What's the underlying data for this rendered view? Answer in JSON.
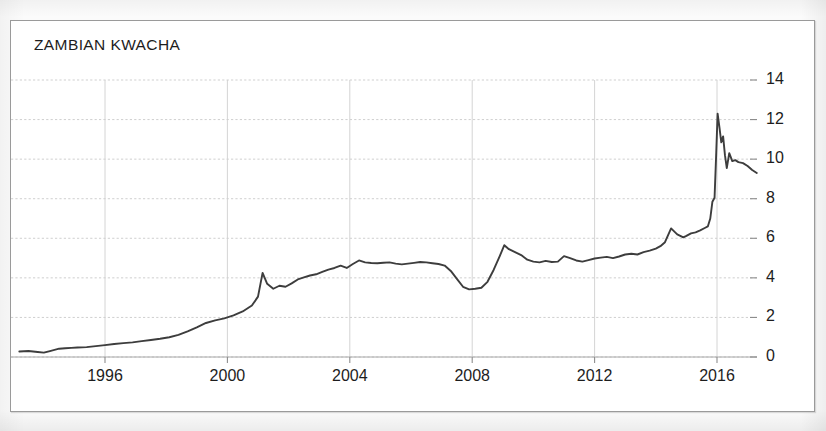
{
  "chart_data": {
    "type": "line",
    "title": "ZAMBIAN KWACHA",
    "xlabel": "",
    "ylabel": "",
    "xlim": [
      1993.2,
      2017.3
    ],
    "ylim": [
      0,
      14
    ],
    "grid": true,
    "legend": "none",
    "series_color": "#3d3d3d",
    "x_ticks": [
      "1996",
      "2000",
      "2004",
      "2008",
      "2012",
      "2016"
    ],
    "x_tick_values": [
      1996,
      2000,
      2004,
      2008,
      2012,
      2016
    ],
    "y_ticks": [
      "0",
      "2",
      "4",
      "6",
      "8",
      "10",
      "12",
      "14"
    ],
    "y_tick_values": [
      0,
      2,
      4,
      6,
      8,
      10,
      12,
      14
    ],
    "series": [
      {
        "name": "Zambian Kwacha per USD",
        "x": [
          1993.2,
          1993.5,
          1993.8,
          1994.0,
          1994.2,
          1994.5,
          1994.7,
          1994.9,
          1995.1,
          1995.4,
          1995.7,
          1996.0,
          1996.3,
          1996.6,
          1996.9,
          1997.2,
          1997.5,
          1997.8,
          1998.1,
          1998.4,
          1998.7,
          1999.0,
          1999.3,
          1999.6,
          1999.9,
          2000.2,
          2000.5,
          2000.8,
          2001.0,
          2001.15,
          2001.3,
          2001.5,
          2001.7,
          2001.9,
          2002.1,
          2002.3,
          2002.5,
          2002.7,
          2002.9,
          2003.1,
          2003.3,
          2003.5,
          2003.7,
          2003.9,
          2004.1,
          2004.3,
          2004.5,
          2004.7,
          2004.9,
          2005.1,
          2005.3,
          2005.5,
          2005.7,
          2005.9,
          2006.1,
          2006.3,
          2006.5,
          2006.7,
          2006.9,
          2007.1,
          2007.3,
          2007.5,
          2007.7,
          2007.9,
          2008.1,
          2008.3,
          2008.5,
          2008.7,
          2008.9,
          2009.05,
          2009.2,
          2009.4,
          2009.6,
          2009.8,
          2010.0,
          2010.2,
          2010.4,
          2010.6,
          2010.8,
          2011.0,
          2011.2,
          2011.4,
          2011.6,
          2011.8,
          2012.0,
          2012.2,
          2012.4,
          2012.6,
          2012.8,
          2013.0,
          2013.2,
          2013.4,
          2013.6,
          2013.8,
          2014.0,
          2014.15,
          2014.3,
          2014.5,
          2014.7,
          2014.9,
          2015.0,
          2015.15,
          2015.3,
          2015.45,
          2015.6,
          2015.7,
          2015.78,
          2015.85,
          2015.92,
          2015.97,
          2016.02,
          2016.08,
          2016.14,
          2016.2,
          2016.26,
          2016.32,
          2016.4,
          2016.5,
          2016.6,
          2016.7,
          2016.85,
          2017.0,
          2017.15,
          2017.3
        ],
        "y": [
          0.28,
          0.3,
          0.25,
          0.22,
          0.3,
          0.42,
          0.44,
          0.46,
          0.48,
          0.5,
          0.55,
          0.6,
          0.66,
          0.7,
          0.74,
          0.8,
          0.86,
          0.92,
          1.0,
          1.12,
          1.3,
          1.5,
          1.72,
          1.85,
          1.95,
          2.1,
          2.3,
          2.6,
          3.05,
          4.25,
          3.7,
          3.45,
          3.6,
          3.55,
          3.72,
          3.92,
          4.02,
          4.12,
          4.18,
          4.3,
          4.42,
          4.5,
          4.62,
          4.5,
          4.7,
          4.88,
          4.78,
          4.75,
          4.74,
          4.76,
          4.78,
          4.72,
          4.68,
          4.72,
          4.76,
          4.8,
          4.78,
          4.74,
          4.7,
          4.62,
          4.35,
          3.95,
          3.55,
          3.42,
          3.45,
          3.5,
          3.8,
          4.4,
          5.1,
          5.65,
          5.45,
          5.3,
          5.15,
          4.92,
          4.82,
          4.78,
          4.86,
          4.8,
          4.82,
          5.1,
          5.0,
          4.88,
          4.82,
          4.9,
          4.98,
          5.02,
          5.06,
          5.0,
          5.08,
          5.18,
          5.22,
          5.18,
          5.3,
          5.38,
          5.48,
          5.6,
          5.8,
          6.5,
          6.2,
          6.05,
          6.12,
          6.25,
          6.3,
          6.4,
          6.52,
          6.6,
          7.0,
          7.85,
          8.05,
          10.1,
          12.3,
          11.6,
          10.85,
          11.15,
          10.2,
          9.55,
          10.3,
          9.9,
          9.95,
          9.85,
          9.8,
          9.65,
          9.45,
          9.3
        ]
      }
    ]
  }
}
